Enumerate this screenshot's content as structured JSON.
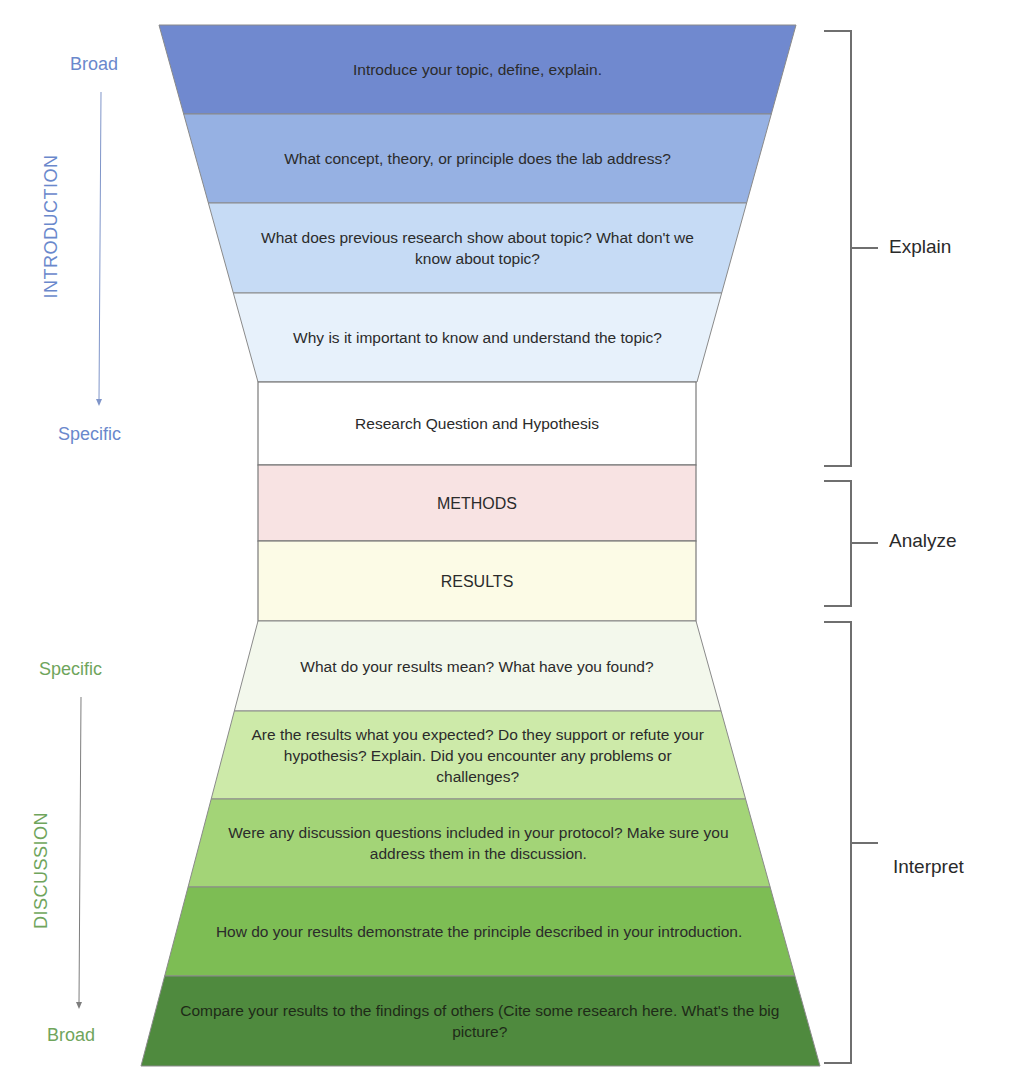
{
  "diagram": {
    "introduction": {
      "section_label": "INTRODUCTION",
      "top_label": "Broad",
      "bottom_label": "Specific",
      "label_color": "#6a88cc",
      "bands": [
        {
          "text": "Introduce your topic, define, explain.",
          "color": "#7089cf"
        },
        {
          "text": "What concept, theory, or principle does the lab address?",
          "color": "#96b1e3"
        },
        {
          "text": "What does previous research show about topic? What don't we know about topic?",
          "color": "#c6dbf5"
        },
        {
          "text": "Why is it important to know and understand the topic?",
          "color": "#e7f1fb"
        }
      ]
    },
    "middle": {
      "boxes": [
        {
          "text": "Research Question and Hypothesis",
          "color": "#ffffff"
        },
        {
          "text": "METHODS",
          "color": "#f8e3e3"
        },
        {
          "text": "RESULTS",
          "color": "#fcfbe6"
        }
      ]
    },
    "discussion": {
      "section_label": "DISCUSSION",
      "top_label": "Specific",
      "bottom_label": "Broad",
      "label_color": "#6fa55c",
      "bands": [
        {
          "text": "What do your results mean? What have you found?",
          "color": "#f3f8ec"
        },
        {
          "text": "Are the results what you expected? Do they support or refute your hypothesis? Explain. Did you encounter any problems or challenges?",
          "color": "#cdeaa9"
        },
        {
          "text": "Were any discussion questions included in your protocol? Make sure you address them in the discussion.",
          "color": "#a3d477"
        },
        {
          "text": "How do your results demonstrate the principle described in your introduction.",
          "color": "#7dbd54"
        },
        {
          "text": "Compare your results to the findings of others (Cite some research here. What's the big picture?",
          "color": "#4f8a3e"
        }
      ]
    },
    "brackets": [
      {
        "label": "Explain"
      },
      {
        "label": "Analyze"
      },
      {
        "label": "Interpret"
      }
    ]
  }
}
